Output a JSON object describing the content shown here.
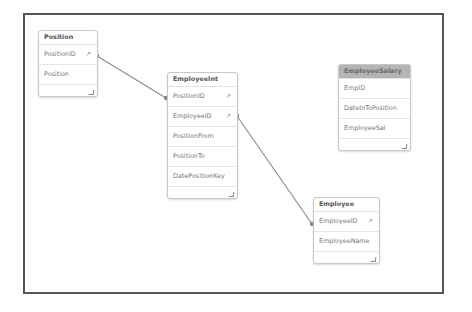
{
  "diagram": {
    "accent_link_color": "#8a8a8a",
    "selected_header_color": "#b4b4b4",
    "tables": [
      {
        "id": "position",
        "name": "Position",
        "selected": false,
        "fields": [
          {
            "name": "PositionID",
            "key": true,
            "key_icon": "↗"
          },
          {
            "name": "Position",
            "key": false
          }
        ]
      },
      {
        "id": "employeeint",
        "name": "EmployeeInt",
        "selected": false,
        "fields": [
          {
            "name": "PositionID",
            "key": true,
            "key_icon": "↗"
          },
          {
            "name": "EmployeeID",
            "key": true,
            "key_icon": "↗"
          },
          {
            "name": "PositionFrom",
            "key": false
          },
          {
            "name": "PositionTo",
            "key": false
          },
          {
            "name": "DatePositionKey",
            "key": false
          }
        ]
      },
      {
        "id": "employeesalary",
        "name": "EmployeeSalary",
        "selected": true,
        "fields": [
          {
            "name": "EmpID",
            "key": false
          },
          {
            "name": "DateInToPosition",
            "key": false
          },
          {
            "name": "EmployeeSal",
            "key": false
          }
        ]
      },
      {
        "id": "employee",
        "name": "Employee",
        "selected": false,
        "fields": [
          {
            "name": "EmployeeID",
            "key": true,
            "key_icon": "↗"
          },
          {
            "name": "EmployeeName",
            "key": false
          }
        ]
      }
    ],
    "links": [
      {
        "from": "Position.PositionID",
        "to": "EmployeeInt.PositionID"
      },
      {
        "from": "EmployeeInt.EmployeeID",
        "to": "Employee.EmployeeID"
      }
    ]
  }
}
